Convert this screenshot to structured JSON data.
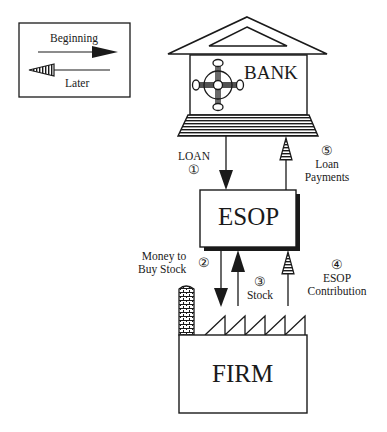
{
  "legend": {
    "beginning_label": "Beginning",
    "later_label": "Later"
  },
  "nodes": {
    "bank": "BANK",
    "esop": "ESOP",
    "firm": "FIRM"
  },
  "flows": [
    {
      "step": "①",
      "label": "LOAN",
      "from": "BANK",
      "to": "ESOP",
      "phase": "Beginning"
    },
    {
      "step": "②",
      "label_line1": "Money to",
      "label_line2": "Buy Stock",
      "from": "ESOP",
      "to": "FIRM",
      "phase": "Beginning"
    },
    {
      "step": "③",
      "label": "Stock",
      "from": "FIRM",
      "to": "ESOP",
      "phase": "Beginning"
    },
    {
      "step": "④",
      "label_line1": "ESOP",
      "label_line2": "Contribution",
      "from": "FIRM",
      "to": "ESOP",
      "phase": "Later"
    },
    {
      "step": "⑤",
      "label_line1": "Loan",
      "label_line2": "Payments",
      "from": "ESOP",
      "to": "BANK",
      "phase": "Later"
    }
  ],
  "colors": {
    "ink": "#1a1a1a",
    "background": "#ffffff"
  }
}
